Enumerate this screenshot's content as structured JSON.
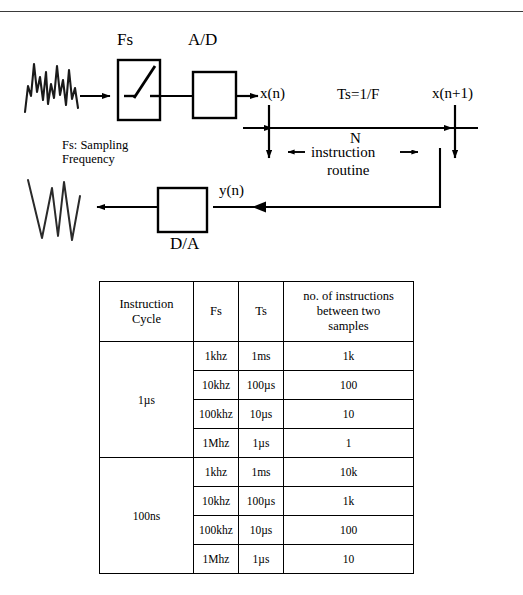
{
  "page": {
    "top_rule": true
  },
  "diagram": {
    "input_waveform_label": "analog-input-waveform",
    "output_waveform_label": "analog-output-waveform",
    "sampler": {
      "label": "Fs",
      "symbol": "switch"
    },
    "adc": {
      "label": "A/D"
    },
    "dac": {
      "label": "D/A"
    },
    "legend": {
      "line1": "Fs: Sampling",
      "line2": "Frequency"
    },
    "signals": {
      "x_n": "x(n)",
      "x_n_plus_1": "x(n+1)",
      "y_n": "y(n)"
    },
    "timing": {
      "period_label": "Ts=1/F",
      "routine_line1": "N",
      "routine_line2": "instruction",
      "routine_line3": "routine"
    }
  },
  "table": {
    "headers": [
      "Instruction\nCycle",
      "Fs",
      "Ts",
      "no. of instructions between two samples"
    ],
    "header_col1_line1": "Instruction",
    "header_col1_line2": "Cycle",
    "header_col2": "Fs",
    "header_col3": "Ts",
    "header_col4_line1": "no. of instructions",
    "header_col4_line2": "between two",
    "header_col4_line3": "samples",
    "groups": [
      {
        "cycle": "1µs",
        "rows": [
          {
            "fs": "1khz",
            "ts": "1ms",
            "count": "1k"
          },
          {
            "fs": "10khz",
            "ts": "100µs",
            "count": "100"
          },
          {
            "fs": "100khz",
            "ts": "10µs",
            "count": "10"
          },
          {
            "fs": "1Mhz",
            "ts": "1µs",
            "count": "1"
          }
        ]
      },
      {
        "cycle": "100ns",
        "rows": [
          {
            "fs": "1khz",
            "ts": "1ms",
            "count": "10k"
          },
          {
            "fs": "10khz",
            "ts": "100µs",
            "count": "1k"
          },
          {
            "fs": "100khz",
            "ts": "10µs",
            "count": "100"
          },
          {
            "fs": "1Mhz",
            "ts": "1µs",
            "count": "10"
          }
        ]
      }
    ]
  },
  "colors": {
    "ink": "#000000",
    "rule": "#3a3a3a",
    "background": "#ffffff"
  }
}
